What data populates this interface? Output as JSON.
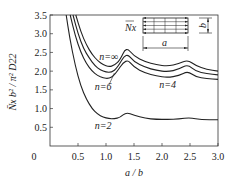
{
  "chart_data": {
    "type": "line",
    "title": "",
    "xlabel": "a / b",
    "ylabel": "N̄x b² / π² D22",
    "xlim": [
      0,
      3.0
    ],
    "ylim": [
      0,
      3.5
    ],
    "x_ticks": [
      "0.5",
      "1.0",
      "1.5",
      "2.0",
      "2.5",
      "3.0"
    ],
    "y_ticks": [
      "0.5",
      "1.0",
      "1.5",
      "2.0",
      "2.5",
      "3.0",
      "3.5"
    ],
    "origin_label": "0",
    "grid": false,
    "legend": "inline annotations",
    "series": [
      {
        "name": "n=∞",
        "x": [
          0.46,
          0.55,
          0.65,
          0.75,
          0.85,
          0.95,
          1.05,
          1.15,
          1.25,
          1.36,
          1.5,
          1.7,
          1.9,
          2.1,
          2.3,
          2.46,
          2.6,
          2.8,
          3.0
        ],
        "y": [
          3.5,
          3.05,
          2.7,
          2.45,
          2.28,
          2.17,
          2.12,
          2.15,
          2.3,
          2.65,
          2.4,
          2.25,
          2.17,
          2.13,
          2.2,
          2.3,
          2.15,
          2.05,
          2.0
        ]
      },
      {
        "name": "n=6",
        "x": [
          0.41,
          0.5,
          0.6,
          0.7,
          0.8,
          0.9,
          1.0,
          1.1,
          1.2,
          1.36,
          1.5,
          1.7,
          1.9,
          2.1,
          2.3,
          2.46,
          2.6,
          2.8,
          3.0
        ],
        "y": [
          3.5,
          3.0,
          2.6,
          2.35,
          2.15,
          2.03,
          1.97,
          1.97,
          2.08,
          2.5,
          2.25,
          2.1,
          2.02,
          1.98,
          2.05,
          2.18,
          2.0,
          1.93,
          1.9
        ]
      },
      {
        "name": "n=4",
        "x": [
          0.36,
          0.45,
          0.55,
          0.65,
          0.75,
          0.85,
          0.95,
          1.05,
          1.15,
          1.36,
          1.5,
          1.7,
          1.9,
          2.1,
          2.3,
          2.46,
          2.6,
          2.8,
          3.0
        ],
        "y": [
          3.5,
          2.95,
          2.5,
          2.2,
          2.0,
          1.88,
          1.82,
          1.8,
          1.88,
          2.35,
          2.1,
          1.95,
          1.87,
          1.83,
          1.88,
          2.0,
          1.85,
          1.8,
          1.78
        ]
      },
      {
        "name": "n=2",
        "x": [
          0.29,
          0.35,
          0.45,
          0.55,
          0.65,
          0.75,
          0.85,
          0.95,
          1.05,
          1.15,
          1.25,
          1.36,
          1.5,
          1.7,
          1.9,
          2.1,
          2.3,
          2.5,
          2.7,
          3.0
        ],
        "y": [
          3.5,
          2.9,
          2.15,
          1.6,
          1.25,
          1.0,
          0.85,
          0.77,
          0.73,
          0.73,
          0.76,
          0.9,
          0.82,
          0.74,
          0.71,
          0.71,
          0.72,
          0.76,
          0.7,
          0.7
        ]
      }
    ],
    "annotations": [
      {
        "text": "n=∞",
        "x": 1.05,
        "y": 2.3
      },
      {
        "text": "n=6",
        "x": 0.95,
        "y": 1.5
      },
      {
        "text": "n=4",
        "x": 2.1,
        "y": 1.55
      },
      {
        "text": "n=2",
        "x": 0.95,
        "y": 0.45
      }
    ],
    "inset": {
      "load_label": "N̄x",
      "length_label": "a",
      "width_label": "b"
    }
  }
}
